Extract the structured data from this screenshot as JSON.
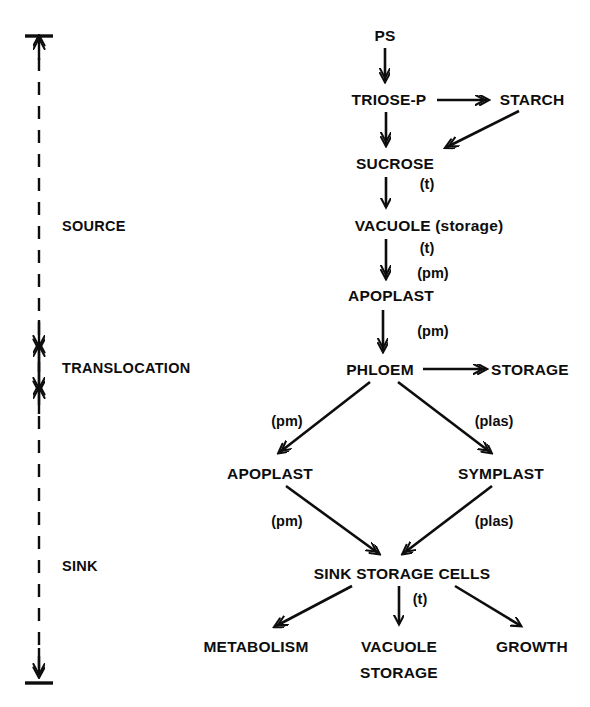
{
  "figure": {
    "type": "flow-diagram",
    "title_visible": false,
    "background_color": "#ffffff",
    "ink_color": "#0d0d0d"
  },
  "zones": {
    "axis_name": "phase-axis",
    "items": [
      {
        "id": "source",
        "label": "SOURCE",
        "x": 62,
        "y": 218
      },
      {
        "id": "translocation",
        "label": "TRANSLOCATION",
        "x": 62,
        "y": 360
      },
      {
        "id": "sink",
        "label": "SINK",
        "x": 62,
        "y": 558
      }
    ]
  },
  "nodes": [
    {
      "id": "ps",
      "label": "PS",
      "cx": 385,
      "y": 27,
      "align": "center"
    },
    {
      "id": "triose-p",
      "label": "TRIOSE-P",
      "cx": 389,
      "y": 91,
      "align": "center"
    },
    {
      "id": "starch",
      "label": "STARCH",
      "cx": 532,
      "y": 91,
      "align": "center"
    },
    {
      "id": "sucrose",
      "label": "SUCROSE",
      "cx": 395,
      "y": 155,
      "align": "center"
    },
    {
      "id": "vacuole-storage",
      "label": "VACUOLE (storage)",
      "cx": 429,
      "y": 217,
      "align": "center"
    },
    {
      "id": "apoplast-source",
      "label": "APOPLAST",
      "cx": 391,
      "y": 287,
      "align": "center"
    },
    {
      "id": "phloem",
      "label": "PHLOEM",
      "cx": 380,
      "y": 361,
      "align": "center"
    },
    {
      "id": "storage",
      "label": "STORAGE",
      "cx": 530,
      "y": 361,
      "align": "center"
    },
    {
      "id": "apoplast-sink",
      "label": "APOPLAST",
      "cx": 270,
      "y": 465,
      "align": "center"
    },
    {
      "id": "symplast",
      "label": "SYMPLAST",
      "cx": 501,
      "y": 465,
      "align": "center"
    },
    {
      "id": "sink-storage-cells",
      "label": "SINK STORAGE CELLS",
      "cx": 402,
      "y": 565,
      "align": "center"
    },
    {
      "id": "metabolism",
      "label": "METABOLISM",
      "cx": 256,
      "y": 638,
      "align": "center"
    },
    {
      "id": "vacuole",
      "label": "VACUOLE",
      "cx": 399,
      "y": 638,
      "align": "center"
    },
    {
      "id": "vacuole-line2",
      "label": "STORAGE",
      "cx": 399,
      "y": 664,
      "align": "center"
    },
    {
      "id": "growth",
      "label": "GROWTH",
      "cx": 532,
      "y": 638,
      "align": "center"
    }
  ],
  "edge_labels": [
    {
      "id": "sucrose-t",
      "label": "(t)",
      "cx": 427,
      "y": 176
    },
    {
      "id": "vacuole-t",
      "label": "(t)",
      "cx": 427,
      "y": 240
    },
    {
      "id": "vacuole-pm",
      "label": "(pm)",
      "cx": 433,
      "y": 265
    },
    {
      "id": "apoplast-pm",
      "label": "(pm)",
      "cx": 433,
      "y": 323
    },
    {
      "id": "upper-left-pm",
      "label": "(pm)",
      "cx": 287,
      "y": 413
    },
    {
      "id": "upper-right-plas",
      "label": "(plas)",
      "cx": 494,
      "y": 413
    },
    {
      "id": "lower-left-pm",
      "label": "(pm)",
      "cx": 287,
      "y": 513
    },
    {
      "id": "lower-right-plas",
      "label": "(plas)",
      "cx": 494,
      "y": 513
    },
    {
      "id": "cells-t",
      "label": "(t)",
      "cx": 420,
      "y": 591
    }
  ],
  "flows": [
    {
      "from": "ps",
      "to": "triose-p",
      "label": ""
    },
    {
      "from": "triose-p",
      "to": "starch",
      "label": ""
    },
    {
      "from": "starch",
      "to": "sucrose",
      "label": ""
    },
    {
      "from": "triose-p",
      "to": "sucrose",
      "label": ""
    },
    {
      "from": "sucrose",
      "to": "vacuole-storage",
      "label": "(t)"
    },
    {
      "from": "vacuole-storage",
      "to": "apoplast-source",
      "label": "(t) (pm)"
    },
    {
      "from": "apoplast-source",
      "to": "phloem",
      "label": "(pm)"
    },
    {
      "from": "phloem",
      "to": "storage",
      "label": ""
    },
    {
      "from": "phloem",
      "to": "apoplast-sink",
      "label": "(pm)"
    },
    {
      "from": "phloem",
      "to": "symplast",
      "label": "(plas)"
    },
    {
      "from": "apoplast-sink",
      "to": "sink-storage-cells",
      "label": "(pm)"
    },
    {
      "from": "symplast",
      "to": "sink-storage-cells",
      "label": "(plas)"
    },
    {
      "from": "sink-storage-cells",
      "to": "metabolism",
      "label": ""
    },
    {
      "from": "sink-storage-cells",
      "to": "vacuole",
      "label": "(t)"
    },
    {
      "from": "sink-storage-cells",
      "to": "growth",
      "label": ""
    }
  ]
}
